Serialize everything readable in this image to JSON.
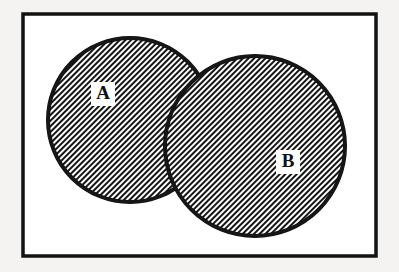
{
  "figure": {
    "kind": "venn-diagram",
    "background_color": "#f4f3f1"
  },
  "universe_box": {
    "name": "universal-set-rectangle",
    "x": 23,
    "y": 14,
    "width": 353,
    "height": 242,
    "stroke_color": "#121212",
    "stroke_width": 3.5,
    "fill_color": "#ffffff"
  },
  "sets": [
    {
      "id": "A",
      "label": "A",
      "cx": 130,
      "cy": 120,
      "r": 82,
      "stroke_color": "#121212",
      "stroke_width": 4,
      "fill": "diagonal-hatch",
      "hatch_angle_deg": 45,
      "label_x": 103,
      "label_y": 94,
      "label_box_w": 24,
      "label_box_h": 24
    },
    {
      "id": "B",
      "label": "B",
      "cx": 255,
      "cy": 146,
      "r": 90,
      "stroke_color": "#121212",
      "stroke_width": 4,
      "fill": "diagonal-hatch",
      "hatch_angle_deg": 45,
      "label_x": 288,
      "label_y": 162,
      "label_box_w": 24,
      "label_box_h": 24
    }
  ],
  "hatch": {
    "name": "diagonal-hatch-pattern",
    "line_color": "#121212",
    "gap_color": "#ffffff",
    "period_px": 4,
    "line_width_px": 2,
    "direction": "backslash"
  },
  "chart_data": {
    "type": "diagram",
    "diagram_type": "venn",
    "sets": [
      "A",
      "B"
    ],
    "regions": [
      {
        "name": "A only",
        "shaded": true
      },
      {
        "name": "A and B (intersection)",
        "shaded": true
      },
      {
        "name": "B only",
        "shaded": true
      },
      {
        "name": "outside A and B (universe)",
        "shaded": false
      }
    ],
    "labels": [
      "A",
      "B"
    ],
    "legend": null,
    "grid": false
  }
}
